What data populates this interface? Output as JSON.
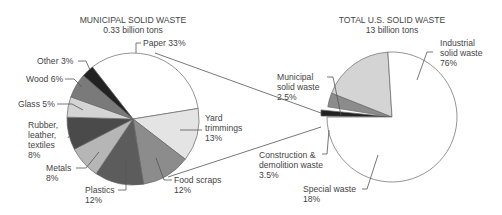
{
  "chart_data": [
    {
      "type": "pie",
      "title": "MUNICIPAL SOLID WASTE",
      "subtitle": "0.33 billion tons",
      "start_angle_deg": -128,
      "direction": "clockwise",
      "slices": [
        {
          "label": "Paper",
          "value": 33,
          "color": "#ffffff"
        },
        {
          "label": "Yard trimmings",
          "value": 13,
          "color": "#e4e4e4"
        },
        {
          "label": "Food scraps",
          "value": 12,
          "color": "#8c8c8c"
        },
        {
          "label": "Plastics",
          "value": 12,
          "color": "#5c5c5c"
        },
        {
          "label": "Metals",
          "value": 8,
          "color": "#b6b6b6"
        },
        {
          "label": "Rubber, leather, textiles",
          "value": 8,
          "color": "#4a4a4a"
        },
        {
          "label": "Glass",
          "value": 5,
          "color": "#d4d4d4"
        },
        {
          "label": "Wood",
          "value": 6,
          "color": "#7a7a7a"
        },
        {
          "label": "Other",
          "value": 3,
          "color": "#222222"
        }
      ],
      "labels": [
        {
          "lines": [
            "Paper 33%"
          ]
        },
        {
          "lines": [
            "Yard",
            "trimmings",
            "13%"
          ]
        },
        {
          "lines": [
            "Food scraps",
            "12%"
          ]
        },
        {
          "lines": [
            "Plastics",
            "12%"
          ]
        },
        {
          "lines": [
            "Metals",
            "8%"
          ]
        },
        {
          "lines": [
            "Rubber,",
            "leather,",
            "textiles",
            "8%"
          ]
        },
        {
          "lines": [
            "Glass 5%"
          ]
        },
        {
          "lines": [
            "Wood 6%"
          ]
        },
        {
          "lines": [
            "Other 3%"
          ]
        }
      ]
    },
    {
      "type": "pie",
      "title": "TOTAL U.S. SOLID WASTE",
      "subtitle": "13 billion tons",
      "start_angle_deg": 180,
      "direction": "clockwise",
      "slices": [
        {
          "label": "Municipal solid waste",
          "value": 2.5,
          "color": "#222222",
          "exploded": true
        },
        {
          "label": "Construction & demolition waste",
          "value": 3.5,
          "color": "#8c8c8c"
        },
        {
          "label": "Special waste",
          "value": 18,
          "color": "#d4d4d4"
        },
        {
          "label": "Industrial solid waste",
          "value": 76,
          "color": "#ffffff"
        }
      ],
      "labels": [
        {
          "lines": [
            "Municipal",
            "solid waste",
            "2.5%"
          ]
        },
        {
          "lines": [
            "Construction &",
            "demolition waste",
            "3.5%"
          ]
        },
        {
          "lines": [
            "Special waste",
            "18%"
          ]
        },
        {
          "lines": [
            "Industrial",
            "solid waste",
            "76%"
          ]
        }
      ]
    }
  ]
}
